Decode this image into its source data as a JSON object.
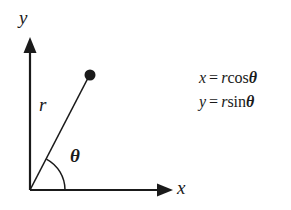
{
  "figure": {
    "background_color": "#ffffff",
    "stroke_color": "#1a1a1a"
  },
  "axes": {
    "y_label": "y",
    "x_label": "x",
    "origin": {
      "x": 30,
      "y": 190
    },
    "y_tip": {
      "x": 30,
      "y": 38
    },
    "x_tip": {
      "x": 172,
      "y": 190
    }
  },
  "radius": {
    "label": "r",
    "point": {
      "x": 90,
      "y": 75
    },
    "dot_radius": 5.5,
    "angle_degrees": 62
  },
  "angle": {
    "label": "θ",
    "arc_radius": 35
  },
  "equations": [
    {
      "lhs": "x",
      "operator": "=",
      "coefficient": "r",
      "function": "cos",
      "argument": "θ"
    },
    {
      "lhs": "y",
      "operator": "=",
      "coefficient": "r",
      "function": "sin",
      "argument": "θ"
    }
  ]
}
